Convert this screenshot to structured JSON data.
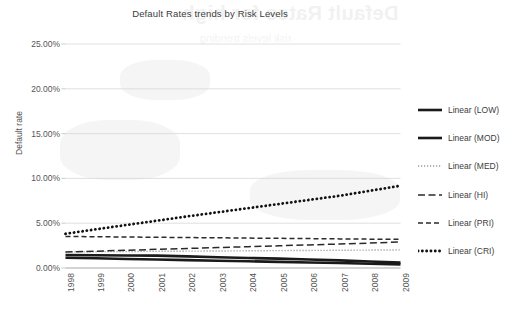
{
  "chart_data": {
    "type": "line",
    "title": "Default Rates trends by Risk Levels",
    "xlabel": "",
    "ylabel": "Default rate",
    "categories": [
      "1998",
      "1999",
      "2000",
      "2001",
      "2002",
      "2003",
      "2004",
      "2005",
      "2006",
      "2007",
      "2008",
      "2009"
    ],
    "x": [
      1998,
      1999,
      2000,
      2001,
      2002,
      2003,
      2004,
      2005,
      2006,
      2007,
      2008,
      2009
    ],
    "ylim": [
      0,
      25
    ],
    "ytick_labels": [
      "25.00%",
      "20.00%",
      "15.00%",
      "10.00%",
      "5.00%",
      "0.00%"
    ],
    "ytick_values": [
      25,
      20,
      15,
      10,
      5,
      0
    ],
    "grid": true,
    "legend_position": "right",
    "series": [
      {
        "name": "Linear (LOW)",
        "style": "thick-solid",
        "color": "#1a1a1a",
        "values": [
          1.15,
          1.08,
          1.01,
          0.95,
          0.88,
          0.81,
          0.75,
          0.68,
          0.61,
          0.55,
          0.48,
          0.41
        ]
      },
      {
        "name": "Linear (MOD)",
        "style": "thick-solid",
        "color": "#1a1a1a",
        "values": [
          1.45,
          1.43,
          1.4,
          1.38,
          1.3,
          1.2,
          1.12,
          1.05,
          0.95,
          0.85,
          0.72,
          0.6
        ]
      },
      {
        "name": "Linear (MED)",
        "style": "fine-dotted",
        "color": "#9a9a9a",
        "values": [
          1.8,
          1.82,
          1.84,
          1.86,
          1.88,
          1.9,
          1.92,
          1.94,
          1.96,
          1.98,
          2.0,
          2.02
        ]
      },
      {
        "name": "Linear (HI)",
        "style": "long-dash",
        "color": "#2a2a2a",
        "values": [
          1.78,
          1.88,
          1.98,
          2.08,
          2.18,
          2.28,
          2.38,
          2.48,
          2.58,
          2.68,
          2.78,
          2.9
        ]
      },
      {
        "name": "Linear (PRI)",
        "style": "dashed",
        "color": "#2a2a2a",
        "values": [
          3.52,
          3.49,
          3.46,
          3.43,
          3.4,
          3.37,
          3.34,
          3.31,
          3.28,
          3.25,
          3.22,
          3.2
        ]
      },
      {
        "name": "Linear (CRI)",
        "style": "bold-dotted",
        "color": "#111111",
        "values": [
          3.82,
          4.32,
          4.8,
          5.28,
          5.76,
          6.22,
          6.68,
          7.14,
          7.6,
          8.06,
          8.62,
          9.18
        ]
      }
    ]
  },
  "legend": {
    "items": [
      {
        "label": "Linear (LOW)"
      },
      {
        "label": "Linear (MOD)"
      },
      {
        "label": "Linear (MED)"
      },
      {
        "label": "Linear (HI)"
      },
      {
        "label": "Linear (PRI)"
      },
      {
        "label": "Linear (CRI)"
      }
    ]
  },
  "bleed": {
    "title": "Default Rates for high",
    "subtitle": "risk levels trending"
  }
}
